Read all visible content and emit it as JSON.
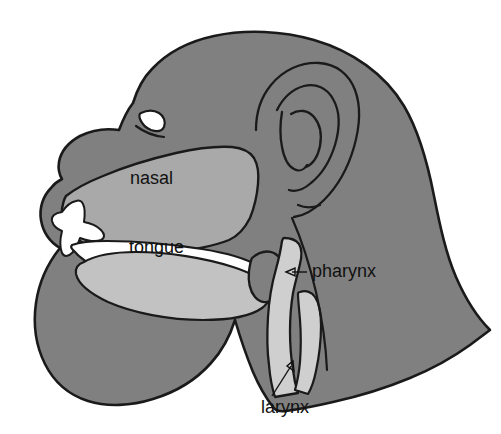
{
  "figure": {
    "background_color": "#ffffff",
    "outline_color": "#1a1a1a",
    "colors": {
      "head_fill": "#808080",
      "cavity_fill": "#a9a9a9",
      "tongue_fill": "#c2c2c2",
      "airway_fill": "#cfcfcf",
      "open_space": "#ffffff",
      "eye_fill": "#ffffff",
      "label_color": "#111111",
      "ear_line": "#1a1a1a"
    }
  },
  "labels": {
    "nasal": {
      "text": "nasal",
      "x": 130,
      "y": 184,
      "has_leader": false
    },
    "tongue": {
      "text": "tongue",
      "x": 129,
      "y": 253,
      "has_leader": false
    },
    "pharynx": {
      "text": "pharynx",
      "x": 312,
      "y": 277,
      "has_leader": true,
      "leader_kind": "horizontal-dash-arrow",
      "arrow_tip_x": 288,
      "arrow_tip_y": 272
    },
    "larynx": {
      "text": "larynx",
      "x": 261,
      "y": 413,
      "has_leader": true,
      "leader_kind": "diagonal-arrow",
      "arrow_tip_x": 288,
      "arrow_tip_y": 362
    }
  },
  "regions": [
    {
      "name": "head-silhouette",
      "fill": "#808080",
      "label": null
    },
    {
      "name": "nasal-cavity",
      "fill": "#a9a9a9",
      "label": "nasal"
    },
    {
      "name": "oral-cavity",
      "fill": "#ffffff",
      "label": null
    },
    {
      "name": "tongue",
      "fill": "#c2c2c2",
      "label": "tongue"
    },
    {
      "name": "pharyngeal-airway",
      "fill": "#cfcfcf",
      "label": "pharynx"
    },
    {
      "name": "laryngeal-airway",
      "fill": "#cfcfcf",
      "label": "larynx"
    },
    {
      "name": "eye",
      "fill": "#ffffff",
      "label": null
    },
    {
      "name": "ear",
      "fill": "none",
      "label": null
    }
  ]
}
